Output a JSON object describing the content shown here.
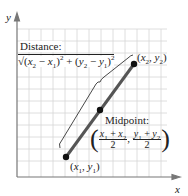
{
  "diagram": {
    "axes": {
      "x_label": "x",
      "y_label": "y"
    },
    "distance": {
      "label": "Distance:",
      "formula_text": "√((x₂ − x₁)² + (y₂ − y₁)²)"
    },
    "midpoint": {
      "label": "Midpoint:",
      "formula_text": "((x₁ + x₂)/2, (y₁ + y₂)/2)"
    },
    "points": [
      {
        "name": "P1",
        "label": "(x₁, y₁)"
      },
      {
        "name": "P2",
        "label": "(x₂, y₂)"
      },
      {
        "name": "M",
        "label": ""
      }
    ],
    "colors": {
      "segment": "#555555",
      "grid": "#d0d0d0",
      "axis": "#777777",
      "point": "#111111"
    }
  }
}
